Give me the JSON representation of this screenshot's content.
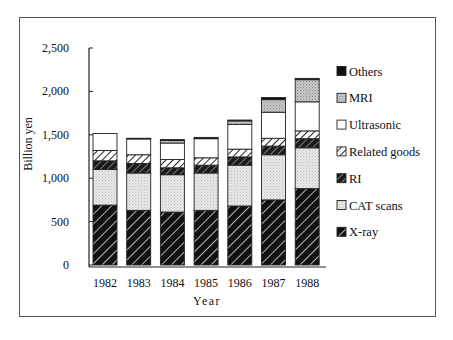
{
  "chart_data": {
    "type": "bar",
    "stacked": true,
    "title": "",
    "xlabel": "Year",
    "ylabel": "Billion yen",
    "ylim": [
      0,
      2500
    ],
    "yticks": [
      0,
      500,
      1000,
      1500,
      2000,
      2500
    ],
    "ytick_labels": [
      "0",
      "500",
      "1,000",
      "1,500",
      "2,000",
      "2,500"
    ],
    "grid": false,
    "legend_position": "right",
    "categories": [
      "1982",
      "1983",
      "1984",
      "1985",
      "1986",
      "1987",
      "1988"
    ],
    "series": [
      {
        "name": "X-ray",
        "pattern": "black-hatch",
        "values": [
          690,
          630,
          610,
          630,
          680,
          750,
          880
        ]
      },
      {
        "name": "CAT scans",
        "pattern": "light-dots",
        "values": [
          410,
          430,
          430,
          430,
          470,
          520,
          470
        ]
      },
      {
        "name": "RI",
        "pattern": "dark-hatch",
        "values": [
          100,
          110,
          80,
          90,
          95,
          100,
          105
        ]
      },
      {
        "name": "Related goods",
        "pattern": "white-hatch",
        "values": [
          120,
          100,
          95,
          85,
          90,
          90,
          90
        ]
      },
      {
        "name": "Ultrasonic",
        "pattern": "white",
        "values": [
          195,
          185,
          190,
          220,
          285,
          300,
          335
        ]
      },
      {
        "name": "MRI",
        "pattern": "grey-dots",
        "values": [
          0,
          0,
          30,
          0,
          40,
          145,
          255
        ]
      },
      {
        "name": "Others",
        "pattern": "black",
        "values": [
          0,
          5,
          10,
          15,
          10,
          25,
          15
        ]
      }
    ],
    "legend_order": [
      "Others",
      "MRI",
      "Ultrasonic",
      "Related goods",
      "RI",
      "CAT scans",
      "X-ray"
    ]
  },
  "axis": {
    "x_title": "Year",
    "y_title": "Billion yen"
  }
}
